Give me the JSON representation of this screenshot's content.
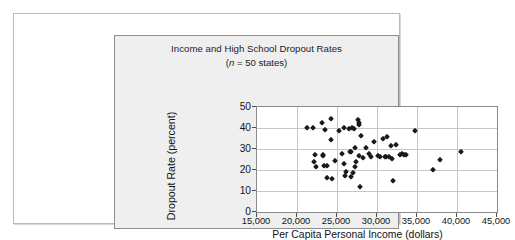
{
  "figure": {
    "background": "#ffffff",
    "panel_background": "#efefef",
    "plot_background": "#ffffff",
    "frame_color": "#8d8d8d",
    "grid_color": "#c6c6c6",
    "marker_color": "#1a1a1a"
  },
  "chart_data": {
    "type": "scatter",
    "title": "Income and High School Dropout Rates",
    "subtitle_prefix": "(",
    "subtitle_italic": "n",
    "subtitle_rest": " = 50 states)",
    "subtitle_full": "(n = 50 states)",
    "xlabel": "Per Capita Personal Income (dollars)",
    "ylabel": "Dropout Rate (percent)",
    "xlim": [
      15000,
      45000
    ],
    "ylim": [
      0,
      50
    ],
    "xticks": [
      15000,
      20000,
      25000,
      30000,
      35000,
      40000,
      45000
    ],
    "xtick_labels": [
      "15,000",
      "20,000",
      "25,000",
      "30,000",
      "35,000",
      "40,000",
      "45,000"
    ],
    "yticks": [
      0,
      10,
      20,
      30,
      40,
      50
    ],
    "ytick_labels": [
      "0",
      "10",
      "20",
      "30",
      "40",
      "50"
    ],
    "grid": true,
    "legend": false,
    "marker": "diamond",
    "n_points": 50,
    "points": [
      [
        21200,
        40.0
      ],
      [
        22000,
        40.0
      ],
      [
        22100,
        24.0
      ],
      [
        22200,
        27.2
      ],
      [
        22400,
        21.4
      ],
      [
        23100,
        42.6
      ],
      [
        23200,
        27.0
      ],
      [
        23300,
        26.9
      ],
      [
        23400,
        21.8
      ],
      [
        23500,
        39.0
      ],
      [
        23700,
        21.8
      ],
      [
        23800,
        16.4
      ],
      [
        24200,
        44.2
      ],
      [
        24300,
        34.2
      ],
      [
        24400,
        15.5
      ],
      [
        24700,
        24.2
      ],
      [
        25300,
        38.5
      ],
      [
        25600,
        27.6
      ],
      [
        25900,
        40.2
      ],
      [
        25900,
        23.0
      ],
      [
        26000,
        17.1
      ],
      [
        26100,
        19.0
      ],
      [
        26500,
        39.4
      ],
      [
        26600,
        28.8
      ],
      [
        26700,
        28.4
      ],
      [
        26800,
        16.8
      ],
      [
        26900,
        40.1
      ],
      [
        27000,
        18.7
      ],
      [
        27100,
        39.6
      ],
      [
        27200,
        30.5
      ],
      [
        27300,
        21.6
      ],
      [
        27400,
        23.6
      ],
      [
        27600,
        44.0
      ],
      [
        27700,
        41.5
      ],
      [
        27700,
        42.2
      ],
      [
        27800,
        26.5
      ],
      [
        27900,
        11.8
      ],
      [
        28000,
        36.0
      ],
      [
        28300,
        25.8
      ],
      [
        28600,
        30.6
      ],
      [
        29000,
        27.4
      ],
      [
        29300,
        26.0
      ],
      [
        29600,
        33.2
      ],
      [
        30100,
        26.5
      ],
      [
        30400,
        26.4
      ],
      [
        30700,
        34.7
      ],
      [
        31000,
        26.4
      ],
      [
        31100,
        26.0
      ],
      [
        31300,
        35.6
      ],
      [
        31500,
        26.2
      ],
      [
        31700,
        31.6
      ],
      [
        31900,
        25.2
      ],
      [
        32000,
        15.0
      ],
      [
        32400,
        32.0
      ],
      [
        32900,
        27.0
      ],
      [
        33100,
        27.6
      ],
      [
        33400,
        27.2
      ],
      [
        33600,
        27.3
      ],
      [
        34700,
        38.6
      ],
      [
        37000,
        20.2
      ],
      [
        37900,
        24.8
      ],
      [
        40500,
        28.5
      ]
    ]
  }
}
